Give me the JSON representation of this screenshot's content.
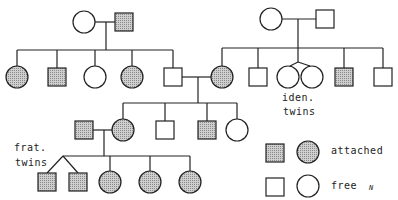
{
  "colors": {
    "line": "#222222",
    "affected_fill": "#b8b8b8",
    "background": "#ffffff"
  },
  "symbols": {
    "size": 18,
    "circle_radius": 11
  },
  "individuals": [
    {
      "id": "I-1",
      "sex": "F",
      "status": "free",
      "x": 84,
      "y": 22
    },
    {
      "id": "I-2",
      "sex": "M",
      "status": "attached",
      "x": 124,
      "y": 22
    },
    {
      "id": "I-3",
      "sex": "F",
      "status": "free",
      "x": 271,
      "y": 19
    },
    {
      "id": "I-4",
      "sex": "M",
      "status": "free",
      "x": 325,
      "y": 19
    },
    {
      "id": "II-1",
      "sex": "F",
      "status": "attached",
      "x": 17,
      "y": 77
    },
    {
      "id": "II-2",
      "sex": "M",
      "status": "attached",
      "x": 57,
      "y": 77
    },
    {
      "id": "II-3",
      "sex": "F",
      "status": "free",
      "x": 95,
      "y": 77
    },
    {
      "id": "II-4",
      "sex": "F",
      "status": "attached",
      "x": 132,
      "y": 77
    },
    {
      "id": "II-5",
      "sex": "M",
      "status": "free",
      "x": 173,
      "y": 77
    },
    {
      "id": "II-6",
      "sex": "F",
      "status": "attached",
      "x": 222,
      "y": 77
    },
    {
      "id": "II-7",
      "sex": "M",
      "status": "free",
      "x": 258,
      "y": 77
    },
    {
      "id": "II-8",
      "sex": "F",
      "status": "free",
      "x": 288,
      "y": 77
    },
    {
      "id": "II-9",
      "sex": "F",
      "status": "free",
      "x": 312,
      "y": 77
    },
    {
      "id": "II-10",
      "sex": "M",
      "status": "attached",
      "x": 344,
      "y": 77
    },
    {
      "id": "II-11",
      "sex": "M",
      "status": "free",
      "x": 383,
      "y": 77
    },
    {
      "id": "III-1",
      "sex": "M",
      "status": "attached",
      "x": 84,
      "y": 130
    },
    {
      "id": "III-2",
      "sex": "F",
      "status": "attached",
      "x": 123,
      "y": 130
    },
    {
      "id": "III-3",
      "sex": "M",
      "status": "free",
      "x": 165,
      "y": 130
    },
    {
      "id": "III-4",
      "sex": "M",
      "status": "attached",
      "x": 207,
      "y": 130
    },
    {
      "id": "III-5",
      "sex": "F",
      "status": "free",
      "x": 237,
      "y": 130
    },
    {
      "id": "IV-1",
      "sex": "M",
      "status": "attached",
      "x": 47,
      "y": 182
    },
    {
      "id": "IV-2",
      "sex": "M",
      "status": "attached",
      "x": 78,
      "y": 182
    },
    {
      "id": "IV-3",
      "sex": "F",
      "status": "attached",
      "x": 110,
      "y": 182
    },
    {
      "id": "IV-4",
      "sex": "F",
      "status": "attached",
      "x": 150,
      "y": 182
    },
    {
      "id": "IV-5",
      "sex": "F",
      "status": "attached",
      "x": 190,
      "y": 182
    }
  ],
  "lines": [
    [
      95,
      22,
      115,
      22
    ],
    [
      106,
      22,
      106,
      50
    ],
    [
      17,
      50,
      173,
      50
    ],
    [
      17,
      50,
      17,
      66
    ],
    [
      57,
      50,
      57,
      68
    ],
    [
      95,
      50,
      95,
      66
    ],
    [
      132,
      50,
      132,
      66
    ],
    [
      173,
      50,
      173,
      68
    ],
    [
      282,
      19,
      316,
      19
    ],
    [
      298,
      19,
      298,
      48
    ],
    [
      222,
      48,
      383,
      48
    ],
    [
      222,
      48,
      222,
      66
    ],
    [
      258,
      48,
      258,
      68
    ],
    [
      298,
      48,
      298,
      62
    ],
    [
      298,
      62,
      290,
      66
    ],
    [
      298,
      62,
      310,
      66
    ],
    [
      344,
      48,
      344,
      68
    ],
    [
      383,
      48,
      383,
      68
    ],
    [
      182,
      77,
      211,
      77
    ],
    [
      198,
      77,
      198,
      103
    ],
    [
      123,
      103,
      237,
      103
    ],
    [
      123,
      103,
      123,
      119
    ],
    [
      165,
      103,
      165,
      121
    ],
    [
      207,
      103,
      207,
      121
    ],
    [
      237,
      103,
      237,
      119
    ],
    [
      93,
      130,
      112,
      130
    ],
    [
      104,
      130,
      104,
      156
    ],
    [
      63,
      156,
      190,
      156
    ],
    [
      63,
      156,
      47,
      173
    ],
    [
      63,
      156,
      78,
      173
    ],
    [
      110,
      156,
      110,
      171
    ],
    [
      150,
      156,
      150,
      171
    ],
    [
      190,
      156,
      190,
      171
    ]
  ],
  "annotations": {
    "iden_twins": {
      "line1": "iden.",
      "line2": "twins"
    },
    "frat_twins": {
      "line1": "frat.",
      "line2": "twins"
    }
  },
  "legend": {
    "attached_label": "attached",
    "free_label": "free",
    "signature": "N"
  }
}
